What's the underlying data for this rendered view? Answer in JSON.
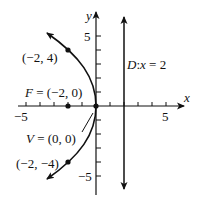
{
  "figure": {
    "axes": {
      "x_label": "x",
      "y_label": "y",
      "x_tick_labels": [
        "−5",
        "5"
      ],
      "y_tick_labels": [
        "5",
        "−5"
      ],
      "range": [
        -5,
        5
      ]
    },
    "labels": {
      "point_upper": "(−2, 4)",
      "point_lower": "(−2, −4)",
      "focus_prefix": "F",
      "focus_value": " = (−2, 0)",
      "vertex_prefix": "V",
      "vertex_value": " = (0, 0)",
      "directrix_prefix": "D",
      "directrix_var": "x",
      "directrix_value": " = 2",
      "directrix_colon": ":"
    },
    "points": [
      {
        "name": "upper",
        "x": -2,
        "y": 4
      },
      {
        "name": "lower",
        "x": -2,
        "y": -4
      },
      {
        "name": "focus",
        "x": -2,
        "y": 0
      },
      {
        "name": "vertex",
        "x": 0,
        "y": 0
      }
    ],
    "equation": "y^2 = -8x",
    "directrix_x": 2,
    "colors": {
      "ink": "#111111",
      "background": "#ffffff"
    }
  }
}
